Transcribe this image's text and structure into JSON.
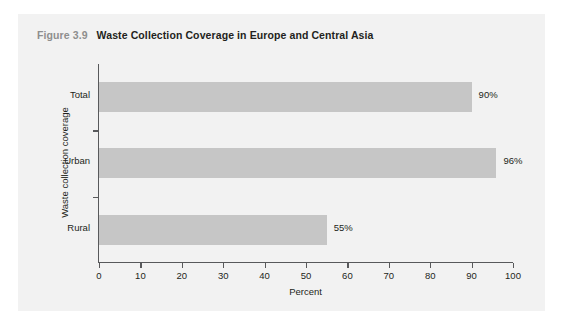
{
  "figure": {
    "number": "Figure 3.9",
    "caption": "Waste Collection Coverage in Europe and Central Asia"
  },
  "colors": {
    "panel_background": "#f2f2f2",
    "bar_fill": "#c6c6c6",
    "axis": "#58595b",
    "figure_number": "#8e8e8e",
    "text": "#231f20"
  },
  "chart_data": {
    "type": "bar",
    "orientation": "horizontal",
    "title": "Waste Collection Coverage in Europe and Central Asia",
    "categories": [
      "Total",
      "Urban",
      "Rural"
    ],
    "values": [
      90,
      96,
      55
    ],
    "value_labels": [
      "90%",
      "96%",
      "55%"
    ],
    "xlabel": "Percent",
    "ylabel": "Waste collection coverage",
    "xlim": [
      0,
      100
    ],
    "xticks": [
      0,
      10,
      20,
      30,
      40,
      50,
      60,
      70,
      80,
      90,
      100
    ],
    "xtick_labels": [
      "0",
      "10",
      "20",
      "30",
      "40",
      "50",
      "60",
      "70",
      "80",
      "90",
      "100"
    ],
    "grid": false,
    "legend": false
  }
}
